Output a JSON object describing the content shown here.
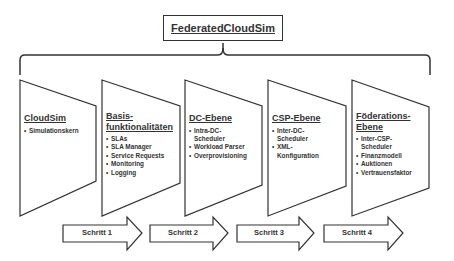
{
  "title": "FederatedCloudSim",
  "panels": [
    {
      "heading": "CloudSim",
      "items": [
        "Simulationskern"
      ]
    },
    {
      "heading": "Basis-funktionalitäten",
      "heading_lines": [
        "Basis-",
        "funktionalitäten"
      ],
      "items": [
        "SLAs",
        "SLA Manager",
        "Service Requests",
        "Monitoring",
        "Logging"
      ]
    },
    {
      "heading": "DC-Ebene",
      "items": [
        "Intra-DC-Scheduler",
        "Workload Parser",
        "Overprovisioning"
      ],
      "item_lines": [
        [
          "Intra-DC-",
          "Scheduler"
        ],
        [
          "Workload Parser"
        ],
        [
          "Overprovisioning"
        ]
      ]
    },
    {
      "heading": "CSP-Ebene",
      "items": [
        "Inter-DC-Scheduler",
        "XML-Konfiguration"
      ],
      "item_lines": [
        [
          "Inter-DC-",
          "Scheduler"
        ],
        [
          "XML-",
          "Konfiguration"
        ]
      ]
    },
    {
      "heading": "Föderations-Ebene",
      "heading_lines": [
        "Föderations-",
        "Ebene"
      ],
      "items": [
        "Inter-CSP-Scheduler",
        "Finanzmodell",
        "Auktionen",
        "Vertrauensfaktor"
      ],
      "item_lines": [
        [
          "Inter-CSP-",
          "Scheduler"
        ],
        [
          "Finanzmodell"
        ],
        [
          "Auktionen"
        ],
        [
          "Vertrauensfaktor"
        ]
      ]
    }
  ],
  "steps": [
    "Schritt 1",
    "Schritt 2",
    "Schritt 3",
    "Schritt 4"
  ],
  "colors": {
    "stroke": "#333333",
    "background": "#ffffff"
  }
}
